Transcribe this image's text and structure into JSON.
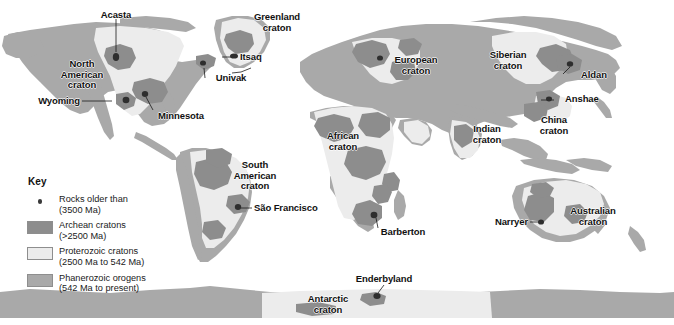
{
  "figure": {
    "type": "world-geological-map",
    "projection": "equirectangular",
    "background_color": "#ffffff"
  },
  "colors": {
    "archean_craton": "#8d8d8d",
    "proterozoic_craton": "#ececec",
    "phanerozoic_orogen": "#a9a9a9",
    "ocean": "#ffffff",
    "point_marker": "#3a3a3a",
    "label_text": "#111111",
    "leader_line": "#1a1a1a"
  },
  "legend": {
    "title": "Key",
    "items": [
      {
        "mark": "dot",
        "line1": "Rocks older than",
        "line2": "(3500 Ma)",
        "text": "Rocks older than\n(3500 Ma)",
        "color": "#3a3a3a"
      },
      {
        "mark": "swatch",
        "line1": "Archean cratons",
        "line2": "(>2500 Ma)",
        "text": "Archean cratons\n(>2500 Ma)",
        "color": "#8d8d8d"
      },
      {
        "mark": "swatch",
        "line1": "Proterozoic cratons",
        "line2": "(2500 Ma to 542 Ma)",
        "text": "Proterozoic cratons\n(2500 Ma to 542 Ma)",
        "color": "#ececec"
      },
      {
        "mark": "swatch",
        "line1": "Phanerozoic orogens",
        "line2": "(542 Ma to present)",
        "text": "Phanerozoic orogens\n(542 Ma to present)",
        "color": "#a9a9a9"
      }
    ]
  },
  "labels": {
    "acasta": "Acasta",
    "north_american_craton": "North\nAmerican\ncraton",
    "wyoming": "Wyoming",
    "minnesota": "Minnesota",
    "greenland_craton": "Greenland\ncraton",
    "itsaq": "Itsaq",
    "univak": "Univak",
    "european_craton": "European\ncraton",
    "siberian_craton": "Siberian\ncraton",
    "aldan": "Aldan",
    "anshae": "Anshae",
    "china_craton": "China\ncraton",
    "indian_craton": "Indian\ncraton",
    "african_craton": "African\ncraton",
    "south_american_craton": "South\nAmerican\ncraton",
    "sao_francisco": "São Francisco",
    "barberton": "Barberton",
    "narryer": "Narryer",
    "australian_craton": "Australian\ncraton",
    "enderbyland": "Enderbyland",
    "antarctic_craton": "Antarctic\ncraton"
  },
  "ancient_rock_sites": [
    {
      "name": "Acasta",
      "x": 116,
      "y": 57
    },
    {
      "name": "Wyoming",
      "x": 126,
      "y": 100
    },
    {
      "name": "Minnesota",
      "x": 145,
      "y": 94
    },
    {
      "name": "Itsaq",
      "x": 234,
      "y": 56
    },
    {
      "name": "Univak",
      "x": 203,
      "y": 63
    },
    {
      "name": "European craton",
      "x": 380,
      "y": 58
    },
    {
      "name": "Aldan",
      "x": 570,
      "y": 64
    },
    {
      "name": "Anshae",
      "x": 549,
      "y": 99
    },
    {
      "name": "São Francisco",
      "x": 238,
      "y": 207
    },
    {
      "name": "Barberton",
      "x": 374,
      "y": 215
    },
    {
      "name": "Narryer",
      "x": 541,
      "y": 222
    },
    {
      "name": "Enderbyland",
      "x": 377,
      "y": 296
    }
  ]
}
